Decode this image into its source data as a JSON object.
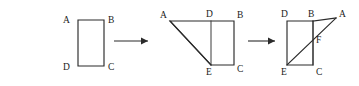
{
  "figure": {
    "background_color": "#ffffff",
    "stroke_color": "#2b2b2b",
    "label_color": "#1b1b1b",
    "canvas": {
      "width": 359,
      "height": 86
    }
  },
  "steps": [
    {
      "id": "step-1",
      "name": "rectangle-abcd",
      "shape": "rectangle",
      "vertices": [
        {
          "key": "A",
          "label": "A",
          "x": 78,
          "y": 20,
          "label_x": 63,
          "label_y": 23
        },
        {
          "key": "B",
          "label": "B",
          "x": 104,
          "y": 20,
          "label_x": 108,
          "label_y": 23
        },
        {
          "key": "C",
          "label": "C",
          "x": 104,
          "y": 66,
          "label_x": 108,
          "label_y": 70
        },
        {
          "key": "D",
          "label": "D",
          "x": 78,
          "y": 66,
          "label_x": 63,
          "label_y": 70
        }
      ],
      "outline": "M 78 20 L 104 20 L 104 66 L 78 66 Z",
      "inner_lines": []
    },
    {
      "id": "step-2",
      "name": "folded-trapezoid-adbce",
      "shape": "trapezoid-with-fold",
      "vertices": [
        {
          "key": "A",
          "label": "A",
          "x": 170,
          "y": 21,
          "label_x": 160,
          "label_y": 18
        },
        {
          "key": "D",
          "label": "D",
          "x": 211,
          "y": 21,
          "label_x": 206,
          "label_y": 17
        },
        {
          "key": "B",
          "label": "B",
          "x": 234,
          "y": 21,
          "label_x": 237,
          "label_y": 18
        },
        {
          "key": "E",
          "label": "E",
          "x": 211,
          "y": 65,
          "label_x": 206,
          "label_y": 75
        },
        {
          "key": "C",
          "label": "C",
          "x": 234,
          "y": 65,
          "label_x": 237,
          "label_y": 72
        }
      ],
      "outline": "M 170 21 L 211 21 L 234 21 L 234 65 L 211 65 Z",
      "inner_lines": [
        {
          "name": "fold-crease-de",
          "d": "M 211 21 L 211 65"
        }
      ],
      "diagonals": [
        {
          "name": "edge-ea",
          "d": "M 211 65 L 170 21"
        }
      ]
    },
    {
      "id": "step-3",
      "name": "folded-rectangle-dbce-with-diagonal",
      "shape": "rectangle-with-diagonal",
      "vertices": [
        {
          "key": "D",
          "label": "D",
          "x": 287,
          "y": 21,
          "label_x": 281,
          "label_y": 17
        },
        {
          "key": "B",
          "label": "B",
          "x": 313,
          "y": 21,
          "label_x": 308,
          "label_y": 17
        },
        {
          "key": "A",
          "label": "A",
          "x": 336,
          "y": 18,
          "label_x": 339,
          "label_y": 17
        },
        {
          "key": "F",
          "label": "F",
          "x": 313,
          "y": 40,
          "label_x": 316,
          "label_y": 43
        },
        {
          "key": "E",
          "label": "E",
          "x": 287,
          "y": 65,
          "label_x": 281,
          "label_y": 75
        },
        {
          "key": "C",
          "label": "C",
          "x": 313,
          "y": 65,
          "label_x": 316,
          "label_y": 75
        }
      ],
      "outline": "M 287 21 L 313 21 L 313 65 L 287 65 Z",
      "inner_lines": [
        {
          "name": "fold-crease-bc",
          "d": "M 313 21 L 313 65"
        },
        {
          "name": "edge-ba",
          "d": "M 313 21 L 336 18"
        }
      ],
      "diagonals": [
        {
          "name": "diagonal-ea-through-f",
          "d": "M 287 65 L 336 18"
        }
      ]
    }
  ],
  "arrows": [
    {
      "id": "arrow-1",
      "name": "transform-arrow-step1-step2",
      "line": {
        "x1": 114,
        "y1": 41,
        "x2": 148,
        "y2": 41
      },
      "head": "148,41 141,37.6 141,44.4"
    },
    {
      "id": "arrow-2",
      "name": "transform-arrow-step2-step3",
      "line": {
        "x1": 248,
        "y1": 41,
        "x2": 275,
        "y2": 41
      },
      "head": "275,41 268,37.6 268,44.4"
    }
  ]
}
